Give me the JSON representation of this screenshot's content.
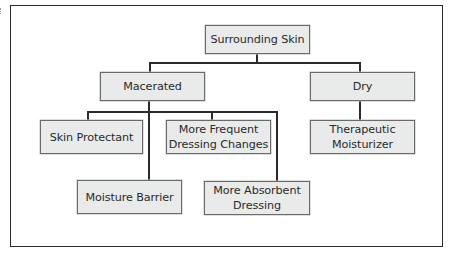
{
  "diagram": {
    "type": "decision-tree",
    "root": {
      "label": "Surrounding Skin"
    },
    "branches": [
      {
        "label": "Macerated",
        "children": [
          {
            "label": "Skin Protectant"
          },
          {
            "label": "More Frequent Dressing Changes",
            "lines": [
              "More Frequent",
              "Dressing Changes"
            ]
          },
          {
            "label": "Moisture Barrier"
          },
          {
            "label": "More Absorbent Dressing",
            "lines": [
              "More Absorbent",
              "Dressing"
            ]
          }
        ]
      },
      {
        "label": "Dry",
        "children": [
          {
            "label": "Therapeutic Moisturizer",
            "lines": [
              "Therapeutic",
              "Moisturizer"
            ]
          }
        ]
      }
    ],
    "colors": {
      "node_fill": "#e9eaea",
      "node_border": "#6a6a6a",
      "connector": "#2a2a2a",
      "frame": "#2b2b2b"
    }
  },
  "nodes": {
    "root": "Surrounding Skin",
    "macerated": "Macerated",
    "dry": "Dry",
    "skin_protectant": "Skin Protectant",
    "more_frequent_l1": "More Frequent",
    "more_frequent_l2": "Dressing Changes",
    "therapeutic_l1": "Therapeutic",
    "therapeutic_l2": "Moisturizer",
    "moisture_barrier": "Moisture Barrier",
    "more_absorbent_l1": "More Absorbent",
    "more_absorbent_l2": "Dressing"
  }
}
